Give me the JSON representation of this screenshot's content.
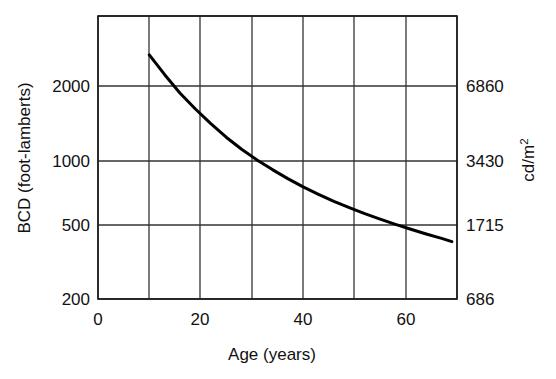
{
  "chart_data": {
    "type": "line",
    "title": "",
    "subtitle": "",
    "xlabel": "Age (years)",
    "ylabel": "BCD (foot-lamberts)",
    "y2label": "cd/m2",
    "y2label_base": "cd/m",
    "y2label_exponent": "2",
    "xlim": [
      0,
      70
    ],
    "ylim": [
      200,
      3400
    ],
    "yscale": "log",
    "y2lim": [
      686,
      11662
    ],
    "grid": true,
    "legend": null,
    "xticks": [
      0,
      20,
      40,
      60
    ],
    "xticklabels": [
      "0",
      "20",
      "40",
      "60"
    ],
    "xgridlines": [
      0,
      10,
      20,
      30,
      40,
      50,
      60,
      70
    ],
    "yticks": [
      2000,
      1000,
      500,
      200
    ],
    "yticklabels": [
      "2000",
      "1000",
      "500",
      "200"
    ],
    "y2ticks": [
      6860,
      3430,
      1715,
      686
    ],
    "y2ticklabels": [
      "6860",
      "3430",
      "1715",
      "686"
    ],
    "series": [
      {
        "name": "BCD vs Age",
        "x": [
          10,
          13,
          16,
          19,
          22,
          25,
          28,
          31,
          34,
          37,
          40,
          43,
          46,
          49,
          52,
          55,
          58,
          61,
          64,
          67,
          69
        ],
        "y": [
          2800,
          2260,
          1850,
          1560,
          1330,
          1150,
          1010,
          900,
          810,
          735,
          672,
          620,
          575,
          537,
          503,
          474,
          448,
          425,
          404,
          385,
          372
        ]
      }
    ],
    "annotations": []
  },
  "figure": {
    "background_color": "#ffffff",
    "line_color": "#000000",
    "grid_color": "#333333",
    "text_color": "#111111"
  }
}
